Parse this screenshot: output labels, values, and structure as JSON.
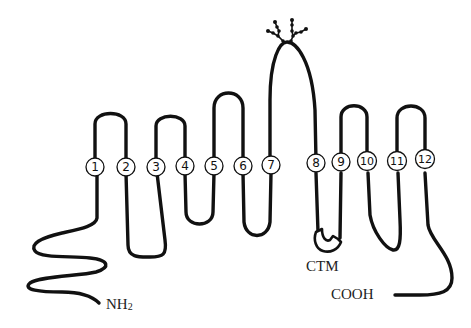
{
  "diagram": {
    "type": "membrane-protein-topology",
    "transmembrane_segments": [
      {
        "id": 1,
        "label": "1"
      },
      {
        "id": 2,
        "label": "2"
      },
      {
        "id": 3,
        "label": "3"
      },
      {
        "id": 4,
        "label": "4"
      },
      {
        "id": 5,
        "label": "5"
      },
      {
        "id": 6,
        "label": "6"
      },
      {
        "id": 7,
        "label": "7"
      },
      {
        "id": 8,
        "label": "8"
      },
      {
        "id": 9,
        "label": "9"
      },
      {
        "id": 10,
        "label": "10"
      },
      {
        "id": 11,
        "label": "11"
      },
      {
        "id": 12,
        "label": "12"
      }
    ],
    "labels": {
      "n_terminus": "NH",
      "n_terminus_sub": "2",
      "c_terminus": "COOH",
      "motif": "CTM"
    },
    "features": {
      "glycosylation_loop": "7-8",
      "ctm_loop": "8-9"
    },
    "colors": {
      "line": "#111111",
      "background": "#ffffff",
      "text": "#222222"
    }
  }
}
